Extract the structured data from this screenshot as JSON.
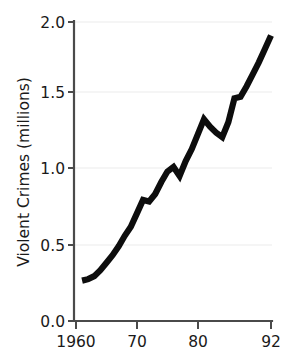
{
  "chart_data": {
    "type": "line",
    "title": "",
    "xlabel": "",
    "ylabel": "Violent Crimes (millions)",
    "xlim": [
      1960,
      1992
    ],
    "ylim": [
      0.0,
      2.0
    ],
    "grid": true,
    "legend": "none",
    "y_ticks": [
      "0.0",
      "0.5",
      "1.0",
      "1.5",
      "2.0"
    ],
    "y_tick_values": [
      0.0,
      0.5,
      1.0,
      1.5,
      2.0
    ],
    "x_ticks": [
      "1960",
      "70",
      "80",
      "92"
    ],
    "x_tick_values": [
      1960,
      1970,
      1980,
      1992
    ],
    "series": [
      {
        "name": "Violent Crimes",
        "color": "#0d0d0d",
        "x": [
          1961,
          1962,
          1963,
          1964,
          1965,
          1966,
          1967,
          1968,
          1969,
          1970,
          1971,
          1972,
          1973,
          1974,
          1975,
          1976,
          1977,
          1978,
          1979,
          1980,
          1981,
          1982,
          1983,
          1984,
          1985,
          1986,
          1987,
          1988,
          1989,
          1990,
          1991,
          1992
        ],
        "values": [
          0.27,
          0.28,
          0.3,
          0.34,
          0.39,
          0.44,
          0.5,
          0.57,
          0.63,
          0.72,
          0.81,
          0.8,
          0.85,
          0.93,
          1.0,
          1.03,
          0.97,
          1.07,
          1.15,
          1.25,
          1.35,
          1.3,
          1.26,
          1.23,
          1.33,
          1.49,
          1.5,
          1.57,
          1.65,
          1.73,
          1.82,
          1.91
        ]
      }
    ]
  },
  "labels": {
    "y_axis_title": "Violent Crimes (millions)"
  }
}
